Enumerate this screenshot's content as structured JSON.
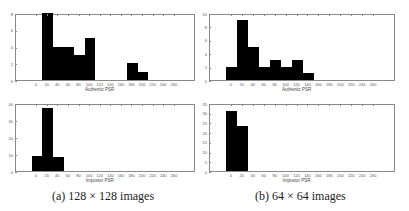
{
  "chart_data": [
    {
      "id": "a-top",
      "type": "bar",
      "title": "",
      "xlabel": "Authentic PSR",
      "ylabel": "",
      "xlim": [
        -40,
        300
      ],
      "ylim": [
        0,
        8
      ],
      "xticks": [
        0,
        20,
        40,
        60,
        80,
        100,
        120,
        140,
        160,
        180,
        200,
        220,
        240,
        260
      ],
      "yticks": [
        0,
        2,
        4,
        6,
        8
      ],
      "bins": [
        {
          "x0": 10,
          "x1": 30,
          "value": 8
        },
        {
          "x0": 30,
          "x1": 50,
          "value": 4
        },
        {
          "x0": 50,
          "x1": 70,
          "value": 4
        },
        {
          "x0": 70,
          "x1": 90,
          "value": 3
        },
        {
          "x0": 90,
          "x1": 110,
          "value": 5
        },
        {
          "x0": 170,
          "x1": 190,
          "value": 2
        },
        {
          "x0": 190,
          "x1": 210,
          "value": 1
        }
      ]
    },
    {
      "id": "a-bottom",
      "type": "bar",
      "title": "",
      "xlabel": "Impostor PSR",
      "ylabel": "",
      "xlim": [
        -40,
        300
      ],
      "ylim": [
        0,
        40
      ],
      "xticks": [
        0,
        20,
        40,
        60,
        80,
        100,
        120,
        140,
        160,
        180,
        200,
        220,
        240,
        260
      ],
      "yticks": [
        0,
        10,
        20,
        30,
        40
      ],
      "bins": [
        {
          "x0": -10,
          "x1": 10,
          "value": 9
        },
        {
          "x0": 10,
          "x1": 30,
          "value": 37
        },
        {
          "x0": 30,
          "x1": 50,
          "value": 8
        }
      ]
    },
    {
      "id": "b-top",
      "type": "bar",
      "title": "",
      "xlabel": "Authentic PSR",
      "ylabel": "",
      "xlim": [
        -40,
        300
      ],
      "ylim": [
        0,
        10
      ],
      "xticks": [
        0,
        20,
        40,
        60,
        80,
        100,
        120,
        140,
        160,
        180,
        200,
        220,
        240,
        260
      ],
      "yticks": [
        0,
        2,
        4,
        6,
        8,
        10
      ],
      "bins": [
        {
          "x0": -10,
          "x1": 10,
          "value": 2
        },
        {
          "x0": 10,
          "x1": 30,
          "value": 9
        },
        {
          "x0": 30,
          "x1": 50,
          "value": 5
        },
        {
          "x0": 50,
          "x1": 70,
          "value": 2
        },
        {
          "x0": 70,
          "x1": 90,
          "value": 3
        },
        {
          "x0": 90,
          "x1": 110,
          "value": 2
        },
        {
          "x0": 110,
          "x1": 130,
          "value": 3
        },
        {
          "x0": 130,
          "x1": 150,
          "value": 1
        }
      ]
    },
    {
      "id": "b-bottom",
      "type": "bar",
      "title": "",
      "xlabel": "Impostor PSR",
      "ylabel": "",
      "xlim": [
        -40,
        300
      ],
      "ylim": [
        0,
        35
      ],
      "xticks": [
        0,
        20,
        40,
        60,
        80,
        100,
        120,
        140,
        160,
        180,
        200,
        220,
        240,
        260
      ],
      "yticks": [
        0,
        5,
        10,
        15,
        20,
        25,
        30,
        35
      ],
      "bins": [
        {
          "x0": -10,
          "x1": 10,
          "value": 31
        },
        {
          "x0": 10,
          "x1": 30,
          "value": 23
        }
      ]
    }
  ],
  "captions": {
    "a": "(a) 128 × 128 images",
    "b": "(b) 64 × 64 images"
  },
  "colors": {
    "bar": "#000000",
    "frame": "#888888"
  }
}
